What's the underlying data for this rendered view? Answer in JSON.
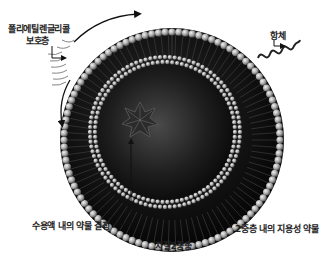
{
  "diagram": {
    "colors": {
      "background": "#ffffff",
      "sphere_dark": "#0d0d0d",
      "sphere_mid": "#3a3a3a",
      "lipid_head": "#bdbdbd",
      "label_text": "#222222",
      "line": "#111111"
    },
    "labels": {
      "peg_line1": "폴리에틸렌글리콜",
      "peg_line2": "보호층",
      "antibody": "항체",
      "aqueous_drug": "수용액 내의 약물 결정",
      "lipid_bilayer": "지질2중층",
      "lipophilic_drug": "2중층 내의 지용성 약물"
    }
  }
}
